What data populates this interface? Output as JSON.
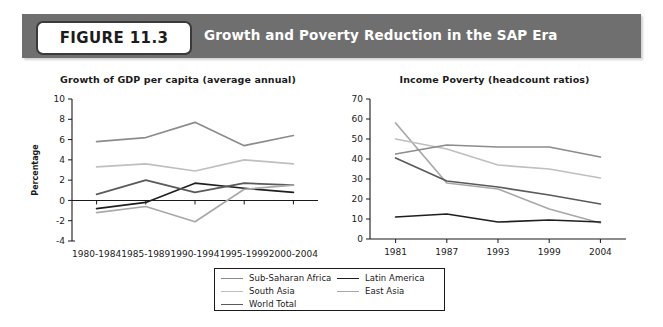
{
  "figure": {
    "badge_label": "FIGURE 11.3",
    "title": "Growth and Poverty Reduction in the SAP Era",
    "banner_color": "#6f6f6f"
  },
  "legend": {
    "columns": [
      [
        {
          "label": "Sub-Saharan Africa",
          "color": "#8c8c8c"
        },
        {
          "label": "South Asia",
          "color": "#bfbfbf"
        },
        {
          "label": "World Total",
          "color": "#5a5a5a"
        }
      ],
      [
        {
          "label": "Latin America",
          "color": "#1f1f1f"
        },
        {
          "label": "East Asia",
          "color": "#a8a8a8"
        }
      ]
    ]
  },
  "chart_data": [
    {
      "id": "growth",
      "type": "line",
      "title": "Growth of GDP per capita (average annual)",
      "xlabel": "",
      "ylabel": "Percentage",
      "categories": [
        "1980-1984",
        "1985-1989",
        "1990-1994",
        "1995-1999",
        "2000-2004"
      ],
      "ylim": [
        -4,
        10
      ],
      "yticks": [
        -4,
        -2,
        0,
        2,
        4,
        6,
        8,
        10
      ],
      "grid": false,
      "zero_line": true,
      "legend_position": "below",
      "series": [
        {
          "name": "East Asia",
          "color": "#8c8c8c",
          "values": [
            5.8,
            6.2,
            7.7,
            5.4,
            6.4
          ]
        },
        {
          "name": "South Asia",
          "color": "#bfbfbf",
          "values": [
            3.3,
            3.6,
            2.9,
            4.0,
            3.6
          ]
        },
        {
          "name": "Latin America",
          "color": "#1f1f1f",
          "values": [
            -0.8,
            -0.2,
            1.7,
            1.2,
            0.8
          ]
        },
        {
          "name": "World Total",
          "color": "#5a5a5a",
          "values": [
            0.6,
            2.0,
            0.8,
            1.7,
            1.5
          ]
        },
        {
          "name": "Sub-Saharan Africa",
          "color": "#a8a8a8",
          "values": [
            -1.2,
            -0.6,
            -2.1,
            1.1,
            1.5
          ]
        }
      ]
    },
    {
      "id": "poverty",
      "type": "line",
      "title": "Income Poverty (headcount ratios)",
      "xlabel": "",
      "ylabel": "",
      "categories": [
        "1981",
        "1987",
        "1993",
        "1999",
        "2004"
      ],
      "ylim": [
        0,
        70
      ],
      "yticks": [
        0,
        10,
        20,
        30,
        40,
        50,
        60,
        70
      ],
      "grid": false,
      "zero_line": false,
      "legend_position": "below",
      "series": [
        {
          "name": "East Asia",
          "color": "#a8a8a8",
          "values": [
            58,
            28,
            25,
            15,
            8
          ]
        },
        {
          "name": "South Asia",
          "color": "#bfbfbf",
          "values": [
            50,
            45,
            37,
            35,
            30.5
          ]
        },
        {
          "name": "Sub-Saharan Africa",
          "color": "#8c8c8c",
          "values": [
            42.5,
            47,
            46,
            46,
            41
          ]
        },
        {
          "name": "World Total",
          "color": "#5a5a5a",
          "values": [
            40.5,
            29,
            26,
            22,
            17.5
          ]
        },
        {
          "name": "Latin America",
          "color": "#1f1f1f",
          "values": [
            11,
            12.5,
            8.5,
            9.5,
            8.5
          ]
        }
      ]
    }
  ]
}
